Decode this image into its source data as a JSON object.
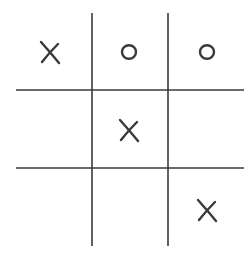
{
  "game": {
    "name": "tic-tac-toe",
    "board": [
      [
        "X",
        "O",
        "O"
      ],
      [
        "",
        "X",
        ""
      ],
      [
        "",
        "",
        "X"
      ]
    ],
    "line_color": "#3a3a3a",
    "mark_color": "#3a3a3a",
    "background": "#ffffff"
  }
}
